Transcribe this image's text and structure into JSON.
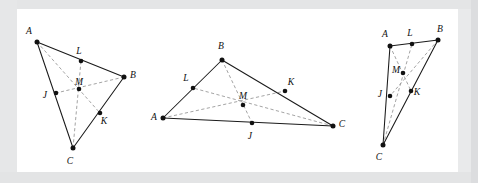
{
  "figure": {
    "background_color": "#e9eaeb",
    "panel_color": "#ffffff",
    "edge_color": "#1a1a1a",
    "cevian_color": "#9a9a9a",
    "vertex_color": "#111111"
  },
  "diagrams": [
    {
      "id": "triangle-left",
      "points": {
        "A": {
          "label": "A",
          "x": 37,
          "y": 42,
          "lx": 29,
          "ly": 34
        },
        "B": {
          "label": "B",
          "x": 124,
          "y": 77,
          "lx": 133,
          "ly": 78
        },
        "C": {
          "label": "C",
          "x": 73,
          "y": 148,
          "lx": 70,
          "ly": 164
        },
        "J": {
          "label": "J",
          "x": 56,
          "y": 93,
          "lx": 45,
          "ly": 98
        },
        "K": {
          "label": "K",
          "x": 100,
          "y": 113,
          "lx": 104,
          "ly": 124
        },
        "L": {
          "label": "L",
          "x": 81,
          "y": 61,
          "lx": 79,
          "ly": 54
        },
        "M": {
          "label": "M",
          "x": 79,
          "y": 89,
          "lx": 79,
          "ly": 85
        }
      },
      "edges": [
        [
          "A",
          "B"
        ],
        [
          "B",
          "C"
        ],
        [
          "C",
          "A"
        ]
      ],
      "cevians": [
        [
          "A",
          "K"
        ],
        [
          "B",
          "J"
        ],
        [
          "C",
          "L"
        ]
      ]
    },
    {
      "id": "triangle-middle",
      "points": {
        "A": {
          "label": "A",
          "x": 163,
          "y": 118,
          "lx": 154,
          "ly": 120
        },
        "B": {
          "label": "B",
          "x": 222,
          "y": 60,
          "lx": 221,
          "ly": 49
        },
        "C": {
          "label": "C",
          "x": 333,
          "y": 126,
          "lx": 342,
          "ly": 127
        },
        "J": {
          "label": "J",
          "x": 252,
          "y": 123,
          "lx": 250,
          "ly": 139
        },
        "K": {
          "label": "K",
          "x": 285,
          "y": 91,
          "lx": 291,
          "ly": 85
        },
        "L": {
          "label": "L",
          "x": 193,
          "y": 88,
          "lx": 186,
          "ly": 81
        },
        "M": {
          "label": "M",
          "x": 243,
          "y": 105,
          "lx": 243,
          "ly": 99
        }
      },
      "edges": [
        [
          "A",
          "B"
        ],
        [
          "B",
          "C"
        ],
        [
          "C",
          "A"
        ]
      ],
      "cevians": [
        [
          "A",
          "K"
        ],
        [
          "B",
          "J"
        ],
        [
          "C",
          "L"
        ]
      ]
    },
    {
      "id": "triangle-right",
      "points": {
        "A": {
          "label": "A",
          "x": 390,
          "y": 46,
          "lx": 385,
          "ly": 37
        },
        "B": {
          "label": "B",
          "x": 438,
          "y": 40,
          "lx": 440,
          "ly": 32
        },
        "C": {
          "label": "C",
          "x": 383,
          "y": 145,
          "lx": 379,
          "ly": 160
        },
        "J": {
          "label": "J",
          "x": 390,
          "y": 96,
          "lx": 380,
          "ly": 97
        },
        "K": {
          "label": "K",
          "x": 411,
          "y": 91,
          "lx": 417,
          "ly": 95
        },
        "L": {
          "label": "L",
          "x": 412,
          "y": 44,
          "lx": 410,
          "ly": 36
        },
        "M": {
          "label": "M",
          "x": 403,
          "y": 73,
          "lx": 396,
          "ly": 73
        }
      },
      "edges": [
        [
          "A",
          "B"
        ],
        [
          "B",
          "C"
        ],
        [
          "C",
          "A"
        ]
      ],
      "cevians": [
        [
          "A",
          "K"
        ],
        [
          "B",
          "J"
        ],
        [
          "C",
          "L"
        ]
      ]
    }
  ]
}
